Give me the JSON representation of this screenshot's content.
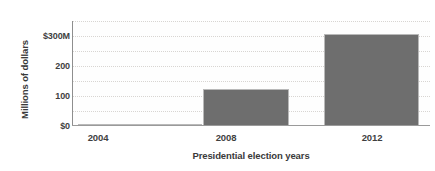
{
  "chart_data": {
    "type": "bar",
    "title": "",
    "subtitle": "",
    "xlabel": "Presidential election years",
    "ylabel": "Millions of dollars",
    "categories": [
      "2004",
      "2008",
      "2012"
    ],
    "values": [
      8,
      123,
      305
    ],
    "ylim": [
      0,
      320
    ],
    "yticks": [
      0,
      100,
      200,
      300
    ],
    "ytick_labels": [
      "$0",
      "100",
      "200",
      "$300M"
    ],
    "grid": "horizontal-dotted",
    "legend": "none",
    "series": [
      {
        "name": "Spending",
        "values": [
          8,
          123,
          305
        ]
      }
    ],
    "annotations": [],
    "colors": {
      "bar_fill": "#6e6e6e",
      "bar_border": "#b9b9b9",
      "gridline": "#d8d5d2",
      "axis": "#8e8e8e",
      "text": "#3f3f3f",
      "background": "#ffffff"
    }
  },
  "axis": {
    "y": {
      "title": "Millions of dollars",
      "ticks": [
        {
          "label": "$300M",
          "value": 300
        },
        {
          "label": "200",
          "value": 200
        },
        {
          "label": "100",
          "value": 100
        },
        {
          "label": "$0",
          "value": 0
        }
      ]
    },
    "x": {
      "title": "Presidential election years",
      "ticks": [
        {
          "label": "2004"
        },
        {
          "label": "2008"
        },
        {
          "label": "2012"
        }
      ]
    }
  }
}
